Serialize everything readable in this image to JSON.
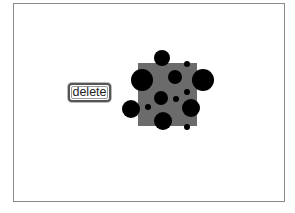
{
  "canvas": {
    "frame": {
      "x": 13,
      "y": 3,
      "width": 272,
      "height": 199,
      "border_color": "#8a8a8a"
    }
  },
  "buttons": {
    "delete_label": "delete"
  },
  "shapes": {
    "square": {
      "x": 138,
      "y": 63,
      "width": 59,
      "height": 63,
      "color": "#6b6b6b"
    },
    "circles": [
      {
        "cx": 162,
        "cy": 58,
        "r": 8
      },
      {
        "cx": 142,
        "cy": 80,
        "r": 11
      },
      {
        "cx": 203,
        "cy": 80,
        "r": 11
      },
      {
        "cx": 175,
        "cy": 77,
        "r": 7
      },
      {
        "cx": 187,
        "cy": 64,
        "r": 3
      },
      {
        "cx": 187,
        "cy": 92,
        "r": 3
      },
      {
        "cx": 161,
        "cy": 98,
        "r": 7
      },
      {
        "cx": 176,
        "cy": 99,
        "r": 3
      },
      {
        "cx": 131,
        "cy": 109,
        "r": 9
      },
      {
        "cx": 148,
        "cy": 107,
        "r": 3
      },
      {
        "cx": 191,
        "cy": 108,
        "r": 9
      },
      {
        "cx": 163,
        "cy": 121,
        "r": 9
      },
      {
        "cx": 187,
        "cy": 127,
        "r": 3
      }
    ],
    "circle_color": "#000000"
  }
}
